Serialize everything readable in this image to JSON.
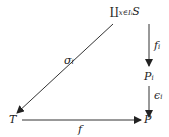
{
  "diagram": {
    "type": "commutative-diagram",
    "nodes": {
      "top": {
        "main": "∐",
        "sub": "x∈I",
        "subsub": "i",
        "tail": "S"
      },
      "mid": {
        "main": "P",
        "sub": "i"
      },
      "bottom_right": {
        "main": "P"
      },
      "bottom_left": {
        "main": "T"
      }
    },
    "arrows": {
      "f_i": {
        "main": "f",
        "sub": "i",
        "from": "top",
        "to": "mid"
      },
      "e_i": {
        "main": "ϵ",
        "sub": "i",
        "from": "mid",
        "to": "bottom_right"
      },
      "sigma_i": {
        "main": "σ",
        "sub": "i",
        "from": "top",
        "to": "bottom_left"
      },
      "f": {
        "main": "f",
        "from": "bottom_left",
        "to": "bottom_right"
      }
    }
  }
}
